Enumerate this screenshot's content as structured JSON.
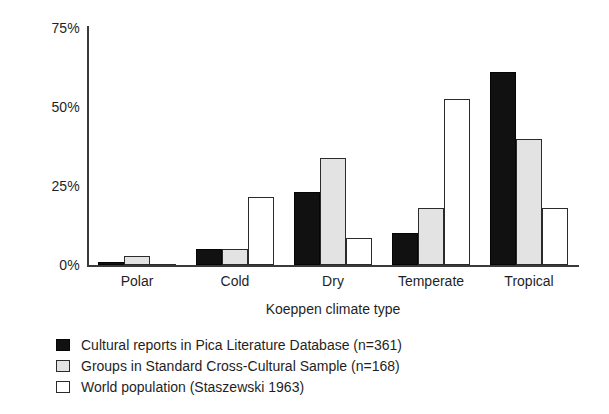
{
  "chart_data": {
    "type": "bar",
    "title": "",
    "subtitle": "",
    "xlabel": "Koeppen climate type",
    "ylabel": "",
    "categories": [
      "Polar",
      "Cold",
      "Dry",
      "Temperate",
      "Tropical"
    ],
    "series": [
      {
        "name": "Cultural reports in Pica Literature Database (n=361)",
        "color": "#111111",
        "values": [
          1,
          5,
          23,
          10,
          61
        ]
      },
      {
        "name": "Groups in Standard Cross-Cultural Sample (n=168)",
        "color": "#e3e3e3",
        "values": [
          3,
          5,
          34,
          18,
          40
        ]
      },
      {
        "name": "World population (Staszewski 1963)",
        "color": "#ffffff",
        "values": [
          0,
          21.5,
          8.5,
          52.5,
          18
        ]
      }
    ],
    "ylim": [
      0,
      75
    ],
    "yticks": [
      0,
      25,
      50,
      75
    ],
    "ytick_labels": [
      "0%",
      "25%",
      "50%",
      "75%"
    ],
    "grid": false,
    "legend_position": "below-axis-left",
    "value_unit": "%"
  },
  "axis": {
    "y_ticks": [
      {
        "label": "75%",
        "value": 75
      },
      {
        "label": "50%",
        "value": 50
      },
      {
        "label": "25%",
        "value": 25
      },
      {
        "label": "0%",
        "value": 0
      }
    ],
    "x_title": "Koeppen climate type"
  },
  "legend": {
    "entries": [
      {
        "label": "Cultural reports in Pica Literature Database (n=361)",
        "swatch": "black-filled"
      },
      {
        "label": "Groups in Standard Cross-Cultural Sample (n=168)",
        "swatch": "gray-filled"
      },
      {
        "label": "World population (Staszewski 1963)",
        "swatch": "white-unfilled"
      }
    ]
  }
}
